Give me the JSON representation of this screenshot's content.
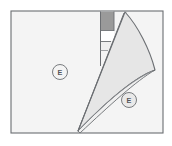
{
  "figure": {
    "type": "technical-line-drawing",
    "canvas": {
      "width": 172,
      "height": 146,
      "background": "#ffffff"
    },
    "colors": {
      "page_background": "#ffffff",
      "sheet_fill": "#f4f4f4",
      "curl_fill": "#e6e6e6",
      "curl_underside_fill": "#efefef",
      "dark_band_fill": "#9a9a9a",
      "gap_fill": "#ffffff",
      "outline": "#6b6e72",
      "thin_line": "#8a8d91",
      "label_stroke": "#6b6e72",
      "label_text": "#55585c"
    },
    "sheet": {
      "name": "main-sheet",
      "bounds": {
        "x": 11,
        "y": 11,
        "width": 152,
        "height": 122
      }
    },
    "dark_band": {
      "name": "exposed-dark-band",
      "bounds": {
        "x": 101,
        "y": 12,
        "width": 13,
        "height": 18
      }
    },
    "gap": {
      "name": "exposed-gap",
      "bounds": {
        "x": 101,
        "y": 30,
        "width": 13,
        "height": 11
      }
    },
    "fold_tip": {
      "x": 78,
      "y": 131
    },
    "curl_apex": {
      "x": 125,
      "y": 12
    },
    "curl_far_corner": {
      "x": 155,
      "y": 70
    },
    "labels": [
      {
        "id": "label-left",
        "text": "E",
        "cx": 60,
        "cy": 72,
        "r": 7.5
      },
      {
        "id": "label-right",
        "text": "E",
        "cx": 129,
        "cy": 100,
        "r": 7.5
      }
    ]
  }
}
